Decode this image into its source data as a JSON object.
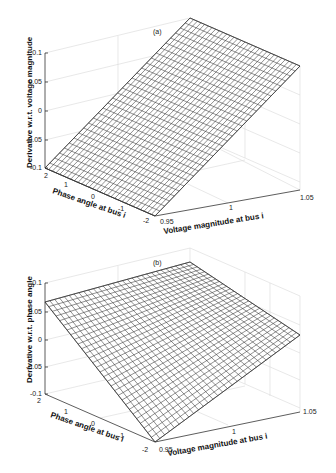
{
  "chart_data": [
    {
      "type": "surface",
      "panel_label": "(a)",
      "zlabel": "Derivative w.r.t. voltage magnitude",
      "xlabel": "Voltage magnitude at bus i",
      "ylabel": "Phase angle at bus i",
      "xlim": [
        0.95,
        1.05
      ],
      "ylim": [
        -2,
        2
      ],
      "zlim": [
        -0.1,
        0.1
      ],
      "x_ticks": [
        "0.95",
        "1",
        "1.05"
      ],
      "y_ticks": [
        "2",
        "1",
        "0",
        "-1",
        "-2"
      ],
      "z_ticks": [
        "0.1",
        "0.05",
        "0",
        "-0.05",
        "-0.1"
      ],
      "grid": true,
      "surface_corners": [
        {
          "x": 0.95,
          "y": 2,
          "z": -0.1
        },
        {
          "x": 0.95,
          "y": -2,
          "z": -0.1
        },
        {
          "x": 1.05,
          "y": -2,
          "z": 0.1
        },
        {
          "x": 1.05,
          "y": 2,
          "z": 0.1
        }
      ],
      "description": "Planar mesh; value increases linearly with voltage magnitude, nearly independent of phase angle"
    },
    {
      "type": "surface",
      "panel_label": "(b)",
      "zlabel": "Derivative w.r.t. phase angle",
      "xlabel": "Voltage magnitude at bus i",
      "ylabel": "Phase angle at bus i",
      "xlim": [
        0.95,
        1.05
      ],
      "ylim": [
        -2,
        2
      ],
      "zlim": [
        -0.1,
        0.1
      ],
      "x_ticks": [
        "0.95",
        "1",
        "1.05"
      ],
      "y_ticks": [
        "2",
        "1",
        "0",
        "-1",
        "-2"
      ],
      "z_ticks": [
        "0.1",
        "0.05",
        "0",
        "-0.05",
        "-0.1"
      ],
      "grid": true,
      "surface_corners": [
        {
          "x": 0.95,
          "y": 2,
          "z": 0.065
        },
        {
          "x": 0.95,
          "y": -2,
          "z": -0.065
        },
        {
          "x": 1.05,
          "y": -2,
          "z": -0.065
        },
        {
          "x": 1.05,
          "y": 2,
          "z": 0.065
        }
      ],
      "description": "Planar mesh; value decreases linearly from phase angle 2 to -2, nearly independent of voltage magnitude"
    }
  ]
}
